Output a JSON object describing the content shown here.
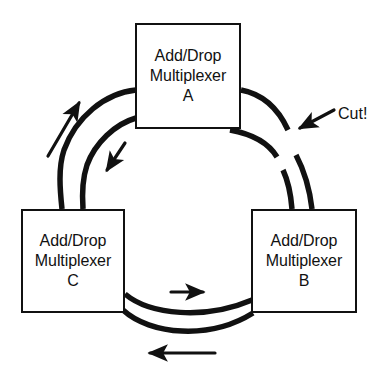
{
  "diagram": {
    "nodes": [
      {
        "id": "a",
        "name": "add-drop-multiplexer-a",
        "line1": "Add/Drop",
        "line2": "Multiplexer",
        "line3": "A"
      },
      {
        "id": "b",
        "name": "add-drop-multiplexer-b",
        "line1": "Add/Drop",
        "line2": "Multiplexer",
        "line3": "B"
      },
      {
        "id": "c",
        "name": "add-drop-multiplexer-c",
        "line1": "Add/Drop",
        "line2": "Multiplexer",
        "line3": "C"
      }
    ],
    "annotations": [
      {
        "id": "cut",
        "name": "cut-label",
        "text": "Cut!"
      }
    ],
    "flow_arrows": [
      {
        "id": "upper-left-outer",
        "direction": "counter-clockwise-up"
      },
      {
        "id": "upper-left-inner",
        "direction": "clockwise-down"
      },
      {
        "id": "bottom-inner",
        "direction": "right"
      },
      {
        "id": "bottom-outer",
        "direction": "left"
      }
    ],
    "colors": {
      "line": "#111111",
      "background": "#ffffff",
      "text": "#111111"
    }
  }
}
